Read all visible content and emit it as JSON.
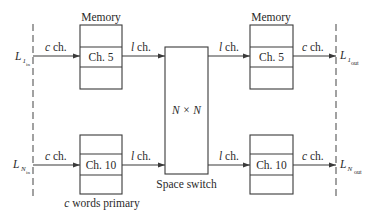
{
  "diagram": {
    "input_lines": [
      {
        "symbol": "L",
        "subscript_index": "1",
        "subscript_dir": "in"
      },
      {
        "symbol": "L",
        "subscript_index": "N",
        "subscript_dir": "in"
      }
    ],
    "output_lines": [
      {
        "symbol": "L",
        "subscript_index": "1",
        "subscript_dir": "out"
      },
      {
        "symbol": "L",
        "subscript_index": "N",
        "subscript_dir": "out"
      }
    ],
    "memory_label": "Memory",
    "memories": {
      "top_left": {
        "slot": "Ch. 5"
      },
      "top_right": {
        "slot": "Ch. 5"
      },
      "bottom_left": {
        "slot": "Ch. 10"
      },
      "bottom_right": {
        "slot": "Ch. 10"
      }
    },
    "links": {
      "in_c": {
        "var": "c",
        "text": " ch."
      },
      "mid_l": {
        "var": "l",
        "text": " ch."
      },
      "out_c": {
        "var": "c",
        "text": " ch."
      }
    },
    "space_switch": {
      "size_label": "N × N",
      "caption": "Space switch"
    },
    "memory_caption": {
      "var": "c",
      "text": " words primary"
    }
  }
}
